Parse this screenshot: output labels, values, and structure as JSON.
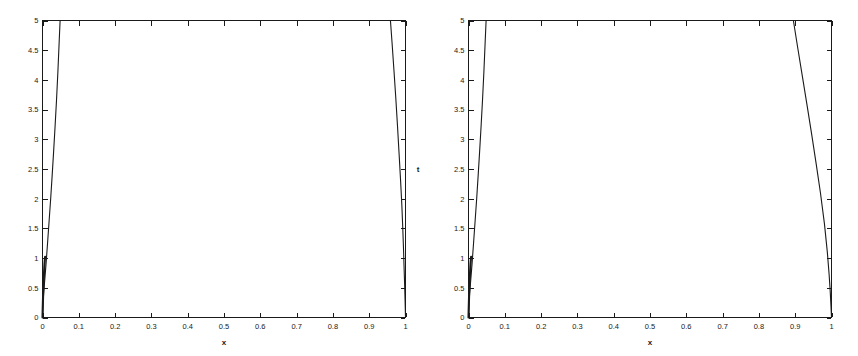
{
  "figure": {
    "background_color": "#ffffff",
    "line_color": "#1a1a1a",
    "panel_count": 2
  },
  "chart_data": [
    {
      "id": "left-panel",
      "type": "line",
      "title": "",
      "subtitle": "",
      "xlabel": "x",
      "ylabel": "t",
      "xlim": [
        0,
        1
      ],
      "ylim": [
        0,
        5
      ],
      "grid": false,
      "legend": "none",
      "box": true,
      "tick_direction": "in",
      "xticks": [
        0,
        0.1,
        0.2,
        0.3,
        0.4,
        0.5,
        0.6,
        0.7,
        0.8,
        0.9,
        1
      ],
      "xticklabels": [
        "0",
        "0.1",
        "0.2",
        "0.3",
        "0.4",
        "0.5",
        "0.6",
        "0.7",
        "0.8",
        "0.9",
        "1"
      ],
      "yticks": [
        0,
        0.5,
        1,
        1.5,
        2,
        2.5,
        3,
        3.5,
        4,
        4.5,
        5
      ],
      "yticklabels": [
        "0",
        "0.5",
        "1",
        "1.5",
        "2",
        "2.5",
        "3",
        "3.5",
        "4",
        "4.5",
        "5"
      ],
      "annotations": [],
      "series": [
        {
          "name": "left-rising-branch",
          "x": [
            0.0,
            0.0015,
            0.003,
            0.006,
            0.01,
            0.0145,
            0.0185,
            0.0225,
            0.0265,
            0.0305,
            0.0345,
            0.0385,
            0.0425,
            0.046,
            0.0485
          ],
          "y": [
            0.0,
            0.22,
            0.4,
            0.62,
            0.92,
            1.3,
            1.65,
            2.0,
            2.38,
            2.78,
            3.2,
            3.65,
            4.15,
            4.65,
            5.0
          ]
        },
        {
          "name": "left-axis-hug-branch",
          "x": [
            0.0,
            0.0004,
            0.0009,
            0.0016,
            0.0025,
            0.0035,
            0.0045,
            0.0055,
            0.0065,
            0.0072
          ],
          "y": [
            0.0,
            0.1,
            0.22,
            0.36,
            0.5,
            0.64,
            0.78,
            0.9,
            0.98,
            1.02
          ]
        },
        {
          "name": "left-top-plateau",
          "x": [
            0.0485,
            0.2,
            0.4,
            0.6,
            0.8,
            0.9585
          ],
          "y": [
            5.0,
            5.0,
            5.0,
            5.0,
            5.0,
            5.0
          ]
        },
        {
          "name": "left-descending-branch",
          "x": [
            0.9585,
            0.963,
            0.968,
            0.973,
            0.978,
            0.9825,
            0.9865,
            0.99,
            0.9925,
            0.9945,
            0.996,
            0.9975,
            0.9988,
            1.0
          ],
          "y": [
            5.0,
            4.62,
            4.18,
            3.72,
            3.22,
            2.74,
            2.3,
            1.88,
            1.5,
            1.16,
            0.86,
            0.58,
            0.3,
            0.0
          ]
        },
        {
          "name": "left-bottom-axis-trace",
          "x": [
            0.0,
            0.2,
            0.5,
            0.8,
            1.0
          ],
          "y": [
            0.0,
            0.0,
            0.0,
            0.0,
            0.0
          ]
        }
      ]
    },
    {
      "id": "right-panel",
      "type": "line",
      "title": "",
      "subtitle": "",
      "xlabel": "x",
      "ylabel": "t",
      "xlim": [
        0,
        1
      ],
      "ylim": [
        0,
        5
      ],
      "grid": false,
      "legend": "none",
      "box": true,
      "tick_direction": "in",
      "xticks": [
        0,
        0.1,
        0.2,
        0.3,
        0.4,
        0.5,
        0.6,
        0.7,
        0.8,
        0.9,
        1
      ],
      "xticklabels": [
        "0",
        "0.1",
        "0.2",
        "0.3",
        "0.4",
        "0.5",
        "0.6",
        "0.7",
        "0.8",
        "0.9",
        "1"
      ],
      "yticks": [
        0,
        0.5,
        1,
        1.5,
        2,
        2.5,
        3,
        3.5,
        4,
        4.5,
        5
      ],
      "yticklabels": [
        "0",
        "0.5",
        "1",
        "1.5",
        "2",
        "2.5",
        "3",
        "3.5",
        "4",
        "4.5",
        "5"
      ],
      "annotations": [],
      "series": [
        {
          "name": "right-rising-branch",
          "x": [
            0.0,
            0.0015,
            0.003,
            0.006,
            0.01,
            0.0145,
            0.0185,
            0.0225,
            0.0265,
            0.0305,
            0.0345,
            0.0385,
            0.0425,
            0.046,
            0.0485
          ],
          "y": [
            0.0,
            0.22,
            0.4,
            0.62,
            0.92,
            1.3,
            1.65,
            2.0,
            2.38,
            2.78,
            3.2,
            3.65,
            4.15,
            4.65,
            5.0
          ]
        },
        {
          "name": "right-axis-hug-branch",
          "x": [
            0.0,
            0.0004,
            0.0009,
            0.0016,
            0.0025,
            0.0035,
            0.0045,
            0.0055,
            0.0065,
            0.0072
          ],
          "y": [
            0.0,
            0.1,
            0.22,
            0.36,
            0.5,
            0.64,
            0.78,
            0.9,
            0.98,
            1.02
          ]
        },
        {
          "name": "right-top-plateau",
          "x": [
            0.0485,
            0.2,
            0.4,
            0.6,
            0.8,
            0.895
          ],
          "y": [
            5.0,
            5.0,
            5.0,
            5.0,
            5.0,
            5.0
          ]
        },
        {
          "name": "right-descending-branch",
          "x": [
            0.895,
            0.9075,
            0.92,
            0.9325,
            0.945,
            0.9575,
            0.9695,
            0.9805,
            0.9885,
            0.9935,
            0.9965,
            0.9985,
            1.0
          ],
          "y": [
            5.0,
            4.52,
            4.05,
            3.58,
            3.1,
            2.6,
            2.1,
            1.58,
            1.1,
            0.72,
            0.44,
            0.2,
            0.0
          ]
        },
        {
          "name": "right-bottom-axis-trace",
          "x": [
            0.0,
            0.2,
            0.5,
            0.8,
            1.0
          ],
          "y": [
            0.0,
            0.0,
            0.0,
            0.0,
            0.0
          ]
        }
      ]
    }
  ]
}
